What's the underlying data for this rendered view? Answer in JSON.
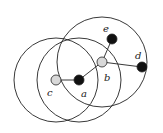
{
  "diagram": {
    "nodes": [
      {
        "id": "c",
        "label": "c",
        "x": 56,
        "y": 80,
        "fill": "#d8d8d8",
        "label_x": 47,
        "label_y": 96
      },
      {
        "id": "a",
        "label": "a",
        "x": 79,
        "y": 80,
        "fill": "#111111",
        "label_x": 81,
        "label_y": 97
      },
      {
        "id": "b",
        "label": "b",
        "x": 102,
        "y": 62,
        "fill": "#d8d8d8",
        "label_x": 104,
        "label_y": 81
      },
      {
        "id": "e",
        "label": "e",
        "x": 112,
        "y": 39,
        "fill": "#111111",
        "label_x": 103,
        "label_y": 32
      },
      {
        "id": "d",
        "label": "d",
        "x": 142,
        "y": 67,
        "fill": "#111111",
        "label_x": 135,
        "label_y": 59
      }
    ],
    "edges": [
      [
        "c",
        "a"
      ],
      [
        "a",
        "b"
      ],
      [
        "b",
        "e"
      ],
      [
        "b",
        "d"
      ]
    ],
    "circles": [
      {
        "center": "c",
        "r": 42
      },
      {
        "center": "a",
        "r": 42
      },
      {
        "center": "b",
        "r": 45
      }
    ]
  }
}
